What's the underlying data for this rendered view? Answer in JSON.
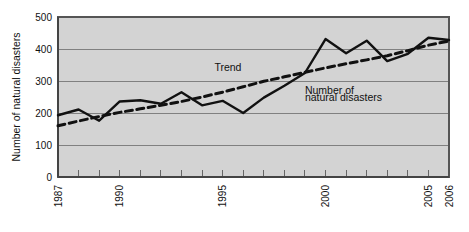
{
  "chart_data": {
    "type": "line",
    "title": "",
    "xlabel": "",
    "ylabel": "Number of natural disasters",
    "xlim": [
      1987,
      2006
    ],
    "ylim": [
      0,
      500
    ],
    "yticks": [
      0,
      100,
      200,
      300,
      400,
      500
    ],
    "ytick_labels": [
      "0",
      "100",
      "200",
      "300",
      "400",
      "500"
    ],
    "xtick_labels": [
      "1987",
      "1990",
      "1995",
      "2000",
      "2005",
      "2006"
    ],
    "xtick_values": [
      1987,
      1990,
      1995,
      2000,
      2005,
      2006
    ],
    "x": [
      1987,
      1988,
      1989,
      1990,
      1991,
      1992,
      1993,
      1994,
      1995,
      1996,
      1997,
      1998,
      1999,
      2000,
      2001,
      2002,
      2003,
      2004,
      2005,
      2006
    ],
    "grid": "horizontal",
    "legend_position": "inline-annotations",
    "series": [
      {
        "name": "Number of natural disasters",
        "style": "solid",
        "color": "#111111",
        "values": [
          193,
          211,
          176,
          236,
          240,
          229,
          265,
          224,
          238,
          200,
          248,
          285,
          325,
          431,
          387,
          426,
          362,
          385,
          435,
          428
        ]
      },
      {
        "name": "Trend",
        "style": "dashed",
        "color": "#111111",
        "values": [
          160,
          175,
          189,
          202,
          213,
          224,
          236,
          250,
          265,
          282,
          299,
          313,
          327,
          341,
          354,
          366,
          379,
          395,
          412,
          425
        ]
      }
    ],
    "annotations": [
      {
        "text": "Trend",
        "x": 1994.6,
        "y": 330
      },
      {
        "text": "Number of",
        "x": 1999.0,
        "y": 258
      },
      {
        "text": "natural disasters",
        "x": 1999.0,
        "y": 238
      }
    ]
  },
  "colors": {
    "plot_background": "#d3d3d3",
    "axis": "#555555",
    "gridline": "#808080",
    "line": "#111111",
    "page_background": "#ffffff"
  }
}
